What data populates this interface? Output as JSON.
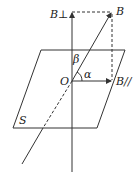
{
  "diagram": {
    "type": "vector-decomposition",
    "labels": {
      "b_perp": "B⊥",
      "b": "B",
      "b_parallel": "B//",
      "beta": "β",
      "alpha": "α",
      "origin": "O",
      "plane": "S"
    },
    "colors": {
      "stroke": "#333333",
      "text": "#222222",
      "background": "#ffffff"
    }
  }
}
